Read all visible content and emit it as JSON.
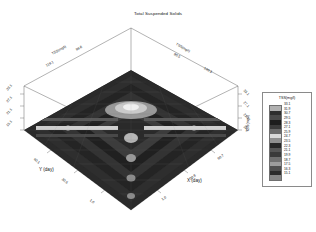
{
  "title": "Total Suspended Solids",
  "axes": {
    "x_label": "X (day)",
    "y_label": "Y (day)",
    "z_label_left": "TSS(mg/l)",
    "z_label_right": "TSS(mg/l)",
    "z_ticks_left": [
      "33.1",
      "27.1",
      "21.1",
      "15.1"
    ],
    "z_ticks_right": [
      "33.1",
      "27.1",
      "21.1",
      "15.1"
    ],
    "x_ticks": [
      "1.0",
      "30.8",
      "60.7",
      "90.5",
      "120.3"
    ],
    "y_ticks": [
      "1.0",
      "30.5",
      "60.1",
      "89.6",
      "119.1"
    ],
    "x_axis_top_label": "TSS(mg/l)",
    "y_axis_top_label": "TSS(mg/l)"
  },
  "legend": {
    "title": "TSS(mg/l)",
    "values": [
      "33.1",
      "31.9",
      "30.7",
      "29.5",
      "28.3",
      "27.1",
      "25.9",
      "24.7",
      "23.5",
      "22.3",
      "21.1",
      "19.9",
      "18.7",
      "17.5",
      "16.3",
      "15.1"
    ],
    "colors": [
      "#b0b0b0",
      "#2e2e2e",
      "#4a4a4a",
      "#1d1d1d",
      "#3b3b3b",
      "#6a6a6a",
      "#d9d9d9",
      "#8f8f8f",
      "#272727",
      "#555555",
      "#3a3a3a",
      "#707070",
      "#9c9c9c",
      "#4f4f4f",
      "#2b2b2b",
      "#868686"
    ]
  },
  "chart_data": {
    "type": "heatmap",
    "title": "Total Suspended Solids",
    "xlabel": "X (day)",
    "ylabel": "Y (day)",
    "zlabel": "TSS(mg/l)",
    "projection": "3d-surface-contour",
    "xlim": [
      1.0,
      120.3
    ],
    "ylim": [
      1.0,
      119.1
    ],
    "zlim": [
      15.1,
      33.1
    ],
    "grid": false,
    "legend_position": "right",
    "contour_levels": [
      15.1,
      16.3,
      17.5,
      18.7,
      19.9,
      21.1,
      22.3,
      23.5,
      24.7,
      25.9,
      27.1,
      28.3,
      29.5,
      30.7,
      31.9,
      33.1
    ],
    "x": [
      1.0,
      30.8,
      60.7,
      90.5,
      120.3
    ],
    "y": [
      1.0,
      30.5,
      60.1,
      89.6,
      119.1
    ],
    "z": [
      [
        15.8,
        17.2,
        19.4,
        17.0,
        15.6
      ],
      [
        17.4,
        21.6,
        26.8,
        21.2,
        17.1
      ],
      [
        19.6,
        27.2,
        33.1,
        26.9,
        19.3
      ],
      [
        17.3,
        21.4,
        26.6,
        21.0,
        17.0
      ],
      [
        15.7,
        17.1,
        19.2,
        16.9,
        15.4
      ]
    ]
  }
}
